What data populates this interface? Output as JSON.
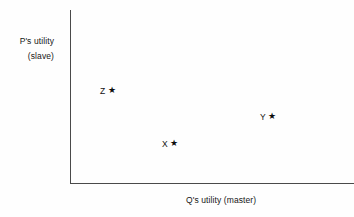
{
  "chart_data": {
    "type": "scatter",
    "title": "",
    "xlabel": "Q's utility (master)",
    "ylabel_line1": "P's utility",
    "ylabel_line2": "(slave)",
    "grid": false,
    "legend": "none",
    "axis_arrows": false,
    "xlim": [
      0,
      1
    ],
    "ylim": [
      0,
      1
    ],
    "xticks": [],
    "yticks": [],
    "marker_glyph": "★",
    "label_position": "left-of-marker",
    "points": [
      {
        "label": "Z",
        "marker": "★",
        "x": 0.148,
        "y": 0.56
      },
      {
        "label": "Y",
        "marker": "★",
        "x": 0.713,
        "y": 0.409
      },
      {
        "label": "X",
        "marker": "★",
        "x": 0.378,
        "y": 0.253
      }
    ]
  },
  "colors": {
    "background": "#fefefe",
    "axis": "#4a4a4a",
    "text": "#161616",
    "marker": "#0d0d0d"
  }
}
